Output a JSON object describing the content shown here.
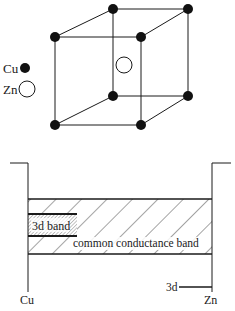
{
  "crystal": {
    "legend": [
      {
        "label": "Cu",
        "marker": "filled-circle"
      },
      {
        "label": "Zn",
        "marker": "open-circle"
      }
    ],
    "structure": "body-centered cubic (CsCl type), Cu at corners, Zn at center"
  },
  "band_diagram": {
    "left_label": "Cu",
    "right_label": "Zn",
    "band_3d_label": "3d band",
    "common_band_label": "common conductance band",
    "zn_3d_label": "3d"
  },
  "colors": {
    "ink": "#1a1a1a",
    "background": "#ffffff"
  }
}
